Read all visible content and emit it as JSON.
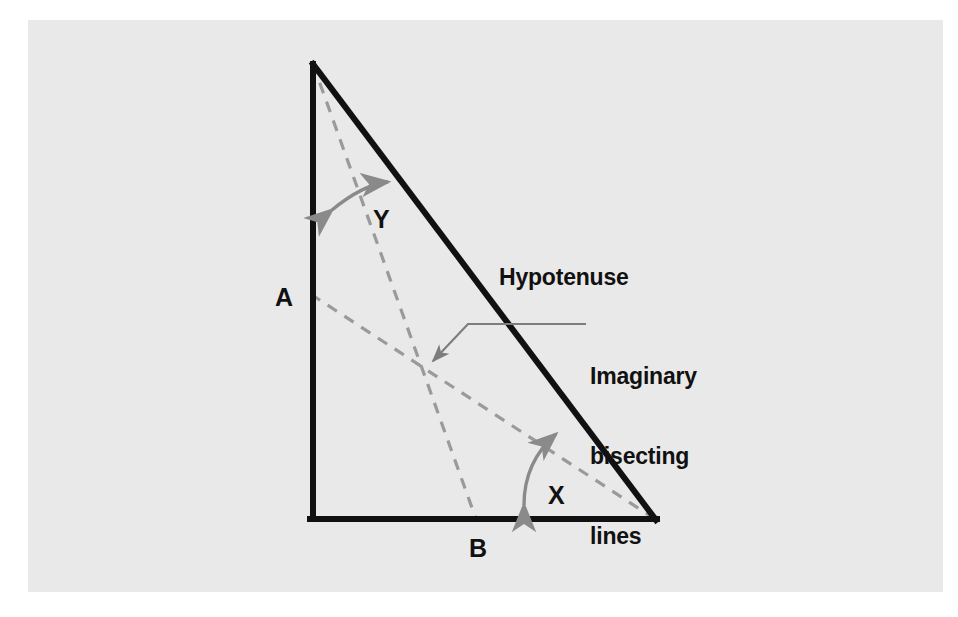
{
  "figure": {
    "kind": "geometry-diagram",
    "background_color": "#ffffff",
    "panel_color": "#e9e9e9",
    "stroke_color": "#111111",
    "dashed_color": "#9a9a9a",
    "arrow_color": "#8a8a8a",
    "leader_color": "#7d7d7d"
  },
  "labels": {
    "side_a": "A",
    "side_b": "B",
    "angle_y": "Y",
    "angle_x": "X",
    "hypotenuse": "Hypotenuse",
    "imaginary_lines_line1": "Imaginary",
    "imaginary_lines_line2": "bisecting",
    "imaginary_lines_line3": "lines"
  },
  "geometry": {
    "apex": [
      313,
      64
    ],
    "bottom_left": [
      312,
      519
    ],
    "bottom_right": [
      655,
      519
    ],
    "bisector_from_apex_end": [
      476,
      519
    ],
    "bisector_from_bottom_right_end": [
      312,
      295
    ],
    "bisector_intersection": [
      425,
      369
    ]
  }
}
